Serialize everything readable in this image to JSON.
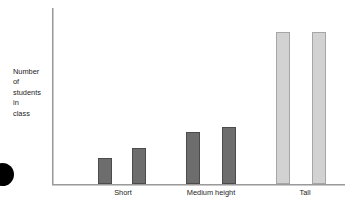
{
  "chart_data": {
    "type": "bar",
    "title": "",
    "subtitle": "",
    "xlabel": "",
    "ylabel": "Number\nof\nstudents\nin\nclass",
    "ylabel_lines": [
      "Number",
      "of",
      "students",
      "in",
      "class"
    ],
    "categories": [
      "Short",
      "Medium height",
      "Tall"
    ],
    "grid": false,
    "legend": false,
    "axis_ticks": false,
    "ylim": [
      0,
      9
    ],
    "series": [
      {
        "name": "Group 1",
        "values": [
          1.5,
          3,
          8.7
        ],
        "color": "#6d6d6d"
      },
      {
        "name": "Group 2",
        "values": [
          2.1,
          3.3,
          8.7
        ],
        "color": "#d2d2d2"
      }
    ],
    "bars": [
      {
        "label": "Short",
        "group": "Short",
        "value": 1.5,
        "shade": "dark",
        "x": 98,
        "top": 158,
        "width": 14,
        "height": 26
      },
      {
        "label": "Short",
        "group": "Short",
        "value": 2.1,
        "shade": "dark",
        "x": 132,
        "top": 148,
        "width": 14,
        "height": 36
      },
      {
        "label": "Medium height",
        "group": "Medium height",
        "value": 3.0,
        "shade": "dark",
        "x": 186,
        "top": 132,
        "width": 14,
        "height": 52
      },
      {
        "label": "Medium height",
        "group": "Medium height",
        "value": 3.3,
        "shade": "dark",
        "x": 222,
        "top": 127,
        "width": 14,
        "height": 57
      },
      {
        "label": "Tall",
        "group": "Tall",
        "value": 8.7,
        "shade": "light",
        "x": 276,
        "top": 32,
        "width": 14,
        "height": 152
      },
      {
        "label": "Tall",
        "group": "Tall",
        "value": 8.7,
        "shade": "light",
        "x": 312,
        "top": 32,
        "width": 14,
        "height": 152
      }
    ],
    "category_positions": [
      123,
      211,
      305
    ],
    "colors": {
      "bar_dark_fill": "#6d6d6d",
      "bar_dark_stroke": "#4b4b4b",
      "bar_light_fill": "#d2d2d2",
      "bar_light_stroke": "#a6a6a6",
      "axis": "#9a9a9a",
      "text": "#1d1d1d",
      "background": "#ffffff",
      "edge_marker": "#000000"
    }
  }
}
